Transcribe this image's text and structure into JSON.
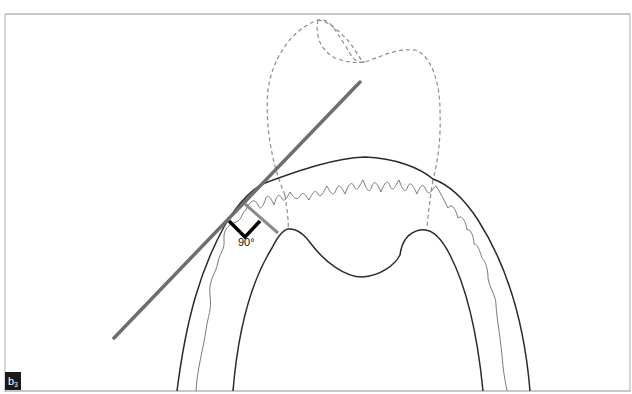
{
  "figure": {
    "panel_label": "b",
    "panel_label_subscript": "3",
    "angle_label": "90°",
    "colors": {
      "background": "#ffffff",
      "frame": "#b5b5b5",
      "outline": "#2a2a2a",
      "tangent_line": "#6e6e6e",
      "dashed_tooth": "#8c8c8c",
      "wavy_bone": "#7a7a7a",
      "right_angle_marker": "#000000",
      "label_bg": "#1a1a1a",
      "label_fg": "#ffffff"
    },
    "elements": [
      "dashed-crown-outline",
      "tangent-line",
      "outer-ridge-contour",
      "inner-sinus-contour",
      "wavy-cortical-line",
      "right-angle-marker",
      "perpendicular-segment"
    ]
  }
}
